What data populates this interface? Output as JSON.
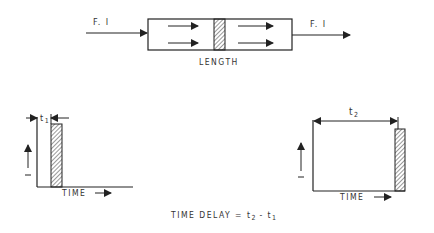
{
  "colors": {
    "ink": "#222222",
    "text": "#333333",
    "background": "#ffffff"
  },
  "pipe_diagram": {
    "inlet_label": "F. I",
    "outlet_label": "F. I",
    "length_label": "LENGTH"
  },
  "input_chart": {
    "time_label": "TIME",
    "dimension_label": "t",
    "dimension_subscript": "1"
  },
  "output_chart": {
    "time_label": "TIME",
    "dimension_label": "t",
    "dimension_subscript": "2"
  },
  "formula": {
    "prefix": "TIME DELAY = ",
    "t2": "t",
    "t2_sub": "2",
    "minus": " - ",
    "t1": "t",
    "t1_sub": "1"
  }
}
